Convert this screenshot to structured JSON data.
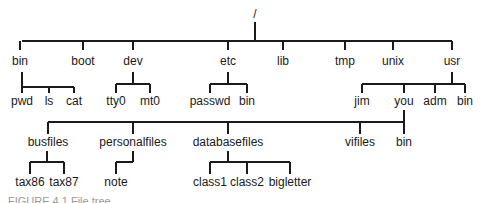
{
  "diagram": {
    "type": "directory-tree",
    "root": {
      "label": "/",
      "x": 255,
      "y": 18
    },
    "levels": [
      {
        "name": "level-1",
        "bar": {
          "y": 41,
          "x1": 22,
          "x2": 452,
          "from_x": 255,
          "from_y": 22
        },
        "label_y": 65,
        "nodes": [
          {
            "id": "bin",
            "label": "bin",
            "x": 20
          },
          {
            "id": "boot",
            "label": "boot",
            "x": 83
          },
          {
            "id": "dev",
            "label": "dev",
            "x": 133
          },
          {
            "id": "etc",
            "label": "etc",
            "x": 228
          },
          {
            "id": "lib",
            "label": "lib",
            "x": 283
          },
          {
            "id": "tmp",
            "label": "tmp",
            "x": 345
          },
          {
            "id": "unix",
            "label": "unix",
            "x": 393
          },
          {
            "id": "usr",
            "label": "usr",
            "x": 452
          }
        ]
      }
    ],
    "groups": [
      {
        "parent": "bin",
        "parent_x": 22,
        "from_y": 72,
        "bar_y": 87,
        "label_y": 105,
        "nodes": [
          {
            "label": "pwd",
            "x": 22
          },
          {
            "label": "ls",
            "x": 49
          },
          {
            "label": "cat",
            "x": 74
          }
        ],
        "parent_at_left": true
      },
      {
        "parent": "dev",
        "parent_x": 133,
        "from_y": 72,
        "bar_y": 84,
        "label_y": 105,
        "nodes": [
          {
            "label": "tty0",
            "x": 116
          },
          {
            "label": "mt0",
            "x": 150
          }
        ]
      },
      {
        "parent": "etc",
        "parent_x": 228,
        "from_y": 72,
        "bar_y": 84,
        "label_y": 105,
        "nodes": [
          {
            "label": "passwd",
            "x": 210
          },
          {
            "label": "bin",
            "x": 247
          }
        ]
      },
      {
        "parent": "usr",
        "parent_x": 452,
        "from_y": 72,
        "bar_y": 84,
        "label_y": 105,
        "nodes": [
          {
            "label": "jim",
            "x": 362
          },
          {
            "label": "you",
            "x": 404
          },
          {
            "label": "adm",
            "x": 435
          },
          {
            "label": "bin",
            "x": 465
          }
        ]
      },
      {
        "parent": "you",
        "parent_x": 404,
        "from_y": 110,
        "bar_y": 122,
        "label_y": 146,
        "nodes": [
          {
            "label": "busfiles",
            "x": 48
          },
          {
            "label": "personalfiles",
            "x": 133
          },
          {
            "label": "databasefiles",
            "x": 228
          },
          {
            "label": "vifiles",
            "x": 360
          },
          {
            "label": "bin",
            "x": 404
          }
        ],
        "parent_at_right": true
      },
      {
        "parent": "busfiles",
        "parent_x": 47,
        "from_y": 151,
        "bar_y": 162,
        "label_y": 186,
        "nodes": [
          {
            "label": "tax86",
            "x": 30
          },
          {
            "label": "tax87",
            "x": 64
          }
        ]
      },
      {
        "parent": "personalfiles",
        "parent_x": 133,
        "from_y": 151,
        "bar_y": 162,
        "label_y": 186,
        "nodes": [
          {
            "label": "note",
            "x": 116
          }
        ],
        "parent_at_right": true
      },
      {
        "parent": "databasefiles",
        "parent_x": 228,
        "from_y": 151,
        "bar_y": 162,
        "label_y": 186,
        "nodes": [
          {
            "label": "class1",
            "x": 210
          },
          {
            "label": "class2",
            "x": 247
          },
          {
            "label": "bigletter",
            "x": 290
          }
        ]
      }
    ],
    "caption": {
      "label": "FIGURE 4.1  File tree",
      "x": 8,
      "y": 205
    }
  }
}
